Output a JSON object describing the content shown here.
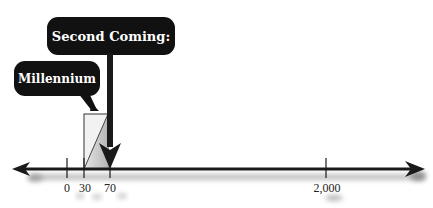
{
  "diagram": {
    "type": "timeline",
    "callouts": {
      "second_coming": {
        "label": "Second Coming:",
        "points_to": "70"
      },
      "millennium": {
        "label": "Millennium",
        "points_to": "30-70 span"
      }
    },
    "axis": {
      "ticks": [
        {
          "label": "0",
          "value": 0
        },
        {
          "label": "30",
          "value": 30
        },
        {
          "label": "70",
          "value": 70
        },
        {
          "label": "2,000",
          "value": 2000
        }
      ],
      "arrows": [
        "left",
        "right"
      ]
    },
    "highlighted_span": {
      "from": "30",
      "to": "70"
    },
    "colors": {
      "bubble_fill": "#111111",
      "bubble_text": "#ffffff",
      "axis": "#1a1a1a",
      "span_fill": "#bdbdbd",
      "shadow": "#9a9a9a"
    }
  }
}
